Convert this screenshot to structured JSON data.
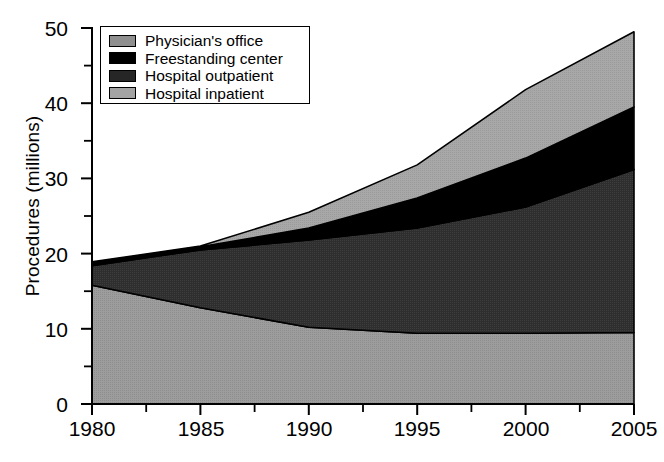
{
  "chart_data": {
    "type": "area",
    "stacked": true,
    "title": "",
    "xlabel": "",
    "ylabel": "Procedures (millions)",
    "x": [
      1980,
      1985,
      1990,
      1995,
      2000,
      2005
    ],
    "xtick_labels": [
      "1980",
      "1985",
      "1990",
      "1995",
      "2000",
      "2005"
    ],
    "ytick_labels": [
      "0",
      "10",
      "20",
      "30",
      "40",
      "50"
    ],
    "ytick_values": [
      0,
      10,
      20,
      30,
      40,
      50
    ],
    "yminor_values": [
      5,
      15,
      25,
      35,
      45
    ],
    "xminor_values": [
      1982.5,
      1987.5,
      1992.5,
      1997.5,
      2002.5
    ],
    "xlim": [
      1980,
      2005
    ],
    "ylim": [
      0,
      50
    ],
    "grid": false,
    "legend_position": "top-left",
    "series": [
      {
        "name": "Hospital inpatient",
        "color": "#9d9d9d",
        "values": [
          15.8,
          12.8,
          10.2,
          9.4,
          9.4,
          9.5
        ]
      },
      {
        "name": "Hospital outpatient",
        "color": "#333333",
        "values": [
          2.6,
          7.7,
          11.6,
          14.0,
          16.8,
          21.7
        ]
      },
      {
        "name": "Freestanding center",
        "color": "#000000",
        "values": [
          0.4,
          0.4,
          1.6,
          4.0,
          6.5,
          8.3
        ]
      },
      {
        "name": "Physician's office",
        "color": "#a8a8a8",
        "values": [
          0.1,
          0.1,
          2.1,
          4.4,
          9.1,
          10.0
        ]
      }
    ],
    "cumulative_tops": {
      "hospital_inpatient": [
        15.8,
        12.8,
        10.2,
        9.4,
        9.4,
        9.5
      ],
      "hospital_outpatient": [
        18.4,
        20.5,
        21.8,
        23.4,
        26.2,
        31.2
      ],
      "freestanding_center": [
        18.8,
        20.9,
        23.4,
        27.4,
        32.7,
        39.5
      ],
      "physicians_office": [
        18.9,
        21.0,
        25.5,
        31.8,
        41.8,
        49.5
      ]
    }
  },
  "legend": {
    "items": [
      {
        "label": "Physician's office",
        "swatch": "medium-gray-swatch"
      },
      {
        "label": "Freestanding center",
        "swatch": "black-swatch"
      },
      {
        "label": "Hospital outpatient",
        "swatch": "dark-gray-swatch"
      },
      {
        "label": "Hospital inpatient",
        "swatch": "light-gray-swatch"
      }
    ]
  },
  "axes": {
    "y_title": "Procedures (millions)",
    "y_labels": [
      "50",
      "40",
      "30",
      "20",
      "10",
      "0"
    ],
    "x_labels": [
      "1980",
      "1985",
      "1990",
      "1995",
      "2000",
      "2005"
    ]
  },
  "caption": {
    "text": ""
  },
  "colors": {
    "physicians_office": "#a8a8a8",
    "freestanding_center": "#000000",
    "hospital_outpatient": "#333333",
    "hospital_inpatient": "#9d9d9d",
    "axis": "#000000",
    "background": "#ffffff"
  }
}
